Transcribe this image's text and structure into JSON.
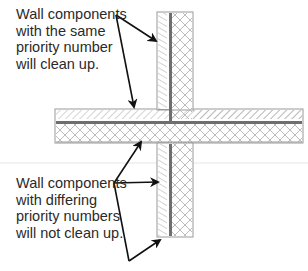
{
  "diagram": {
    "type": "wall-cleanup-intersection",
    "labels": {
      "same_priority": {
        "lines": [
          "Wall components",
          "with the same",
          "priority number",
          "will clean up."
        ]
      },
      "differing_priority": {
        "lines": [
          "Wall components",
          "with differing",
          "priority numbers",
          "will not clean up."
        ]
      }
    },
    "colors": {
      "text": "#2a2a2a",
      "arrow": "#111111",
      "outline": "#9a9a9a",
      "hatch": "#a8a8a8",
      "core_line": "#6e6e6e",
      "crosshatch": "#b5b5b5",
      "background": "#ffffff"
    }
  }
}
